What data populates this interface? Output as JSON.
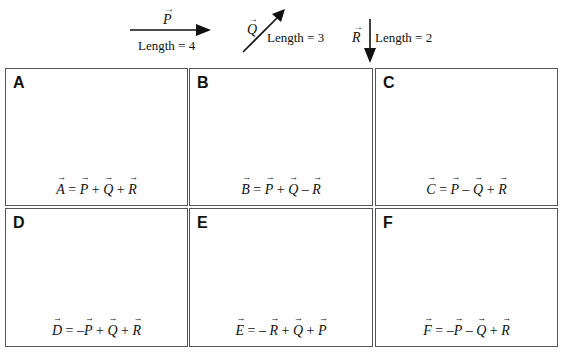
{
  "legend": {
    "vectors": [
      {
        "name": "P",
        "length_label": "Length = 4",
        "direction": "right"
      },
      {
        "name": "Q",
        "length_label": "Length = 3",
        "direction": "up-right"
      },
      {
        "name": "R",
        "length_label": "Length = 2",
        "direction": "down"
      }
    ]
  },
  "boxes": [
    {
      "letter": "A",
      "equation": {
        "lhs": "A",
        "terms": [
          [
            "",
            "P"
          ],
          [
            "+",
            "Q"
          ],
          [
            "+",
            "R"
          ]
        ]
      },
      "equation_text": "A = P + Q + R"
    },
    {
      "letter": "B",
      "equation": {
        "lhs": "B",
        "terms": [
          [
            "",
            "P"
          ],
          [
            "+",
            "Q"
          ],
          [
            "–",
            "R"
          ]
        ]
      },
      "equation_text": "B = P + Q – R"
    },
    {
      "letter": "C",
      "equation": {
        "lhs": "C",
        "terms": [
          [
            "",
            "P"
          ],
          [
            "–",
            "Q"
          ],
          [
            "+",
            "R"
          ]
        ]
      },
      "equation_text": "C = P – Q + R"
    },
    {
      "letter": "D",
      "equation": {
        "lhs": "D",
        "terms": [
          [
            "–",
            "P"
          ],
          [
            "+",
            "Q"
          ],
          [
            "+",
            "R"
          ]
        ]
      },
      "equation_text": "D = –P + Q + R"
    },
    {
      "letter": "E",
      "equation": {
        "lhs": "E",
        "terms": [
          [
            "–",
            "R"
          ],
          [
            "+",
            "Q"
          ],
          [
            "+",
            "P"
          ]
        ]
      },
      "equation_text": "E = – R + Q + P"
    },
    {
      "letter": "F",
      "equation": {
        "lhs": "F",
        "terms": [
          [
            "–",
            "P"
          ],
          [
            "–",
            "Q"
          ],
          [
            "+",
            "R"
          ]
        ]
      },
      "equation_text": "F = –P – Q + R"
    }
  ],
  "colors": {
    "stroke": "#111111",
    "box_border": "#555555",
    "background": "#ffffff"
  }
}
